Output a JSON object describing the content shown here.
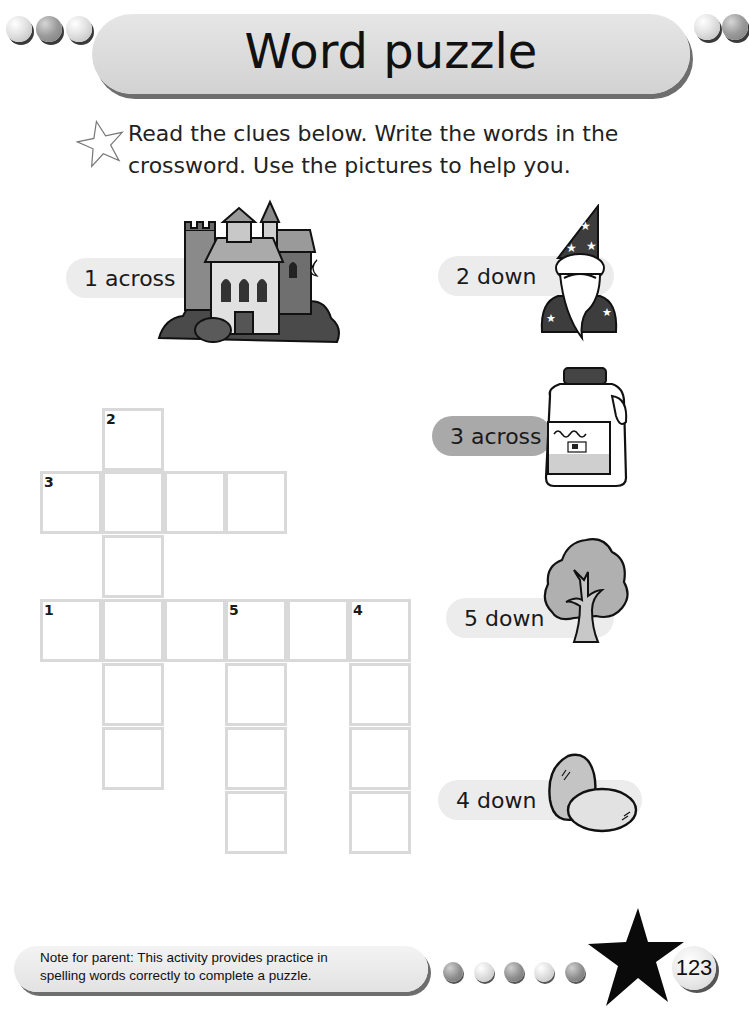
{
  "header": {
    "title": "Word puzzle",
    "left_dots": [
      "light",
      "dark",
      "light"
    ],
    "right_dots": [
      "light",
      "dark"
    ]
  },
  "instructions": {
    "icon": "star-outline-icon",
    "text": "Read the clues below. Write the words in the crossword. Use the pictures to help you."
  },
  "clues": [
    {
      "id": "1-across",
      "label": "1 across",
      "picture": "castle",
      "answer_length": 6,
      "pill_shade": "light"
    },
    {
      "id": "2-down",
      "label": "2 down",
      "picture": "wizard",
      "answer_length": 6,
      "pill_shade": "light"
    },
    {
      "id": "3-across",
      "label": "3 across",
      "picture": "milk",
      "answer_length": 4,
      "pill_shade": "dark"
    },
    {
      "id": "5-down",
      "label": "5 down",
      "picture": "tree",
      "answer_length": 4,
      "pill_shade": "light"
    },
    {
      "id": "4-down",
      "label": "4 down",
      "picture": "eggs",
      "answer_length": 4,
      "pill_shade": "light"
    }
  ],
  "crossword": {
    "cell_size": 62,
    "origin": {
      "x": 40,
      "y": 408
    },
    "cells": [
      {
        "col": 1,
        "row": 0,
        "number": "2"
      },
      {
        "col": 0,
        "row": 1,
        "number": "3"
      },
      {
        "col": 1,
        "row": 1,
        "number": ""
      },
      {
        "col": 2,
        "row": 1,
        "number": ""
      },
      {
        "col": 3,
        "row": 1,
        "number": ""
      },
      {
        "col": 1,
        "row": 2,
        "number": ""
      },
      {
        "col": 0,
        "row": 3,
        "number": "1"
      },
      {
        "col": 1,
        "row": 3,
        "number": ""
      },
      {
        "col": 2,
        "row": 3,
        "number": ""
      },
      {
        "col": 3,
        "row": 3,
        "number": "5"
      },
      {
        "col": 4,
        "row": 3,
        "number": ""
      },
      {
        "col": 5,
        "row": 3,
        "number": "4"
      },
      {
        "col": 1,
        "row": 4,
        "number": ""
      },
      {
        "col": 3,
        "row": 4,
        "number": ""
      },
      {
        "col": 5,
        "row": 4,
        "number": ""
      },
      {
        "col": 1,
        "row": 5,
        "number": ""
      },
      {
        "col": 3,
        "row": 5,
        "number": ""
      },
      {
        "col": 5,
        "row": 5,
        "number": ""
      },
      {
        "col": 3,
        "row": 6,
        "number": ""
      },
      {
        "col": 5,
        "row": 6,
        "number": ""
      }
    ]
  },
  "footer": {
    "note_line1": "Note for parent: This activity provides practice in",
    "note_line2": "spelling words correctly to complete a puzzle.",
    "dots": [
      "dark",
      "light",
      "dark",
      "light",
      "dark"
    ],
    "page_number": "123"
  },
  "colors": {
    "band": "#d8d8d8",
    "pill_light": "#ececec",
    "pill_dark": "#a9a9a9",
    "grid_line": "#d9d9d9",
    "ink": "#1a1a1a"
  }
}
